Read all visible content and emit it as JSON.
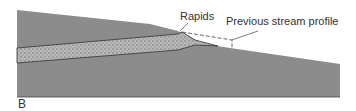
{
  "figure": {
    "panel_label": "B",
    "labels": {
      "rapids": "Rapids",
      "previous_profile": "Previous stream profile"
    },
    "colors": {
      "ground": "#8c8c8c",
      "sediment": "#b4b4b4",
      "outline": "#333333",
      "background": "#ffffff"
    }
  }
}
